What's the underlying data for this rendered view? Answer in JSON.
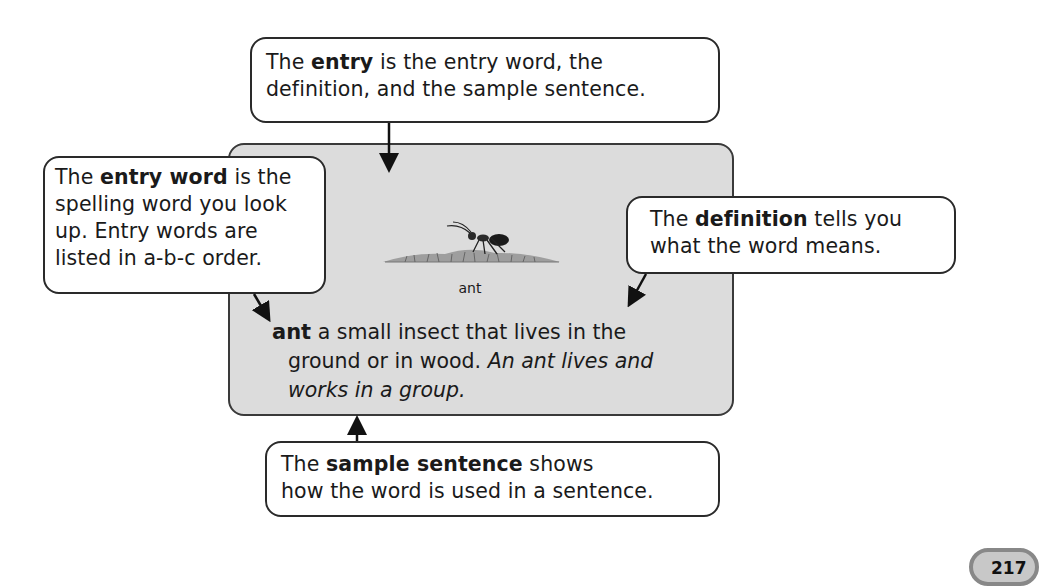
{
  "card": {
    "background": "#dcdcdc",
    "picture_caption": "ant",
    "entry": {
      "entry_word": "ant",
      "definition_part1": "a small insect that lives in the",
      "definition_part2": "ground or in wood.",
      "sample_part1": "An ant lives and",
      "sample_part2": "works in a group."
    }
  },
  "callouts": {
    "entry": {
      "pre": "The ",
      "term": "entry",
      "line1_post": " is the entry word, the",
      "line2": "definition, and the sample sentence."
    },
    "entry_word": {
      "pre": "The ",
      "term": "entry word",
      "line1_post": " is the",
      "line2": "spelling word you look",
      "line3": "up. Entry words are",
      "line4": "listed in a-b-c order."
    },
    "definition": {
      "pre": "The ",
      "term": "definition",
      "line1_post": " tells you",
      "line2": "what the word means."
    },
    "sample_sentence": {
      "pre": "The ",
      "term": "sample sentence",
      "line1_post": " shows",
      "line2": "how the word is used in a sentence."
    }
  },
  "page_number": "217"
}
